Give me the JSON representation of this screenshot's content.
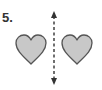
{
  "problem": {
    "number_label": "5.",
    "description": "Two identical hearts with a dashed vertical line of symmetry between them"
  },
  "colors": {
    "heart_fill": "#c8c8c8",
    "heart_stroke": "#555555",
    "line": "#333333"
  },
  "icons": {
    "left_shape": "heart-icon",
    "right_shape": "heart-icon",
    "axis": "double-arrow-dashed-vertical"
  }
}
